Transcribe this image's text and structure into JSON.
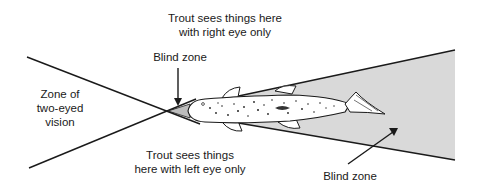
{
  "diagram": {
    "labels": {
      "right_eye": {
        "line1": "Trout sees things here",
        "line2": "with right eye only"
      },
      "blind_zone_front": "Blind zone",
      "two_eyed": {
        "line1": "Zone of",
        "line2": "two-eyed",
        "line3": "vision"
      },
      "left_eye": {
        "line1": "Trout sees things",
        "line2": "here with left eye only"
      },
      "blind_zone_rear": "Blind zone"
    },
    "colors": {
      "line": "#1a1a1a",
      "blind_zone_fill": "#d9d9d9",
      "fish_body": "#ffffff",
      "fish_spots": "#222222",
      "background": "#ffffff"
    }
  }
}
